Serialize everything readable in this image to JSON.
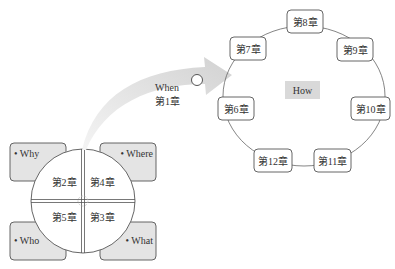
{
  "arrow": {
    "label_top": "When",
    "label_bottom": "第1章"
  },
  "ring": {
    "center_label": "How",
    "chapters": [
      {
        "id": "ch8",
        "label": "第8章"
      },
      {
        "id": "ch7",
        "label": "第7章"
      },
      {
        "id": "ch9",
        "label": "第9章"
      },
      {
        "id": "ch6",
        "label": "第6章"
      },
      {
        "id": "ch10",
        "label": "第10章"
      },
      {
        "id": "ch12",
        "label": "第12章"
      },
      {
        "id": "ch11",
        "label": "第11章"
      }
    ]
  },
  "quad": {
    "corners": {
      "top_left": "• Why",
      "top_right": "• Where",
      "bottom_left": "• Who",
      "bottom_right": "• What"
    },
    "quadrants": {
      "top_left": "第2章",
      "top_right": "第4章",
      "bottom_left": "第5章",
      "bottom_right": "第3章"
    }
  },
  "colors": {
    "box_fill": "#e4e4e4",
    "how_fill": "#d9d9d9",
    "stroke": "#555555",
    "arrow_fill": "#d8d8d8"
  }
}
